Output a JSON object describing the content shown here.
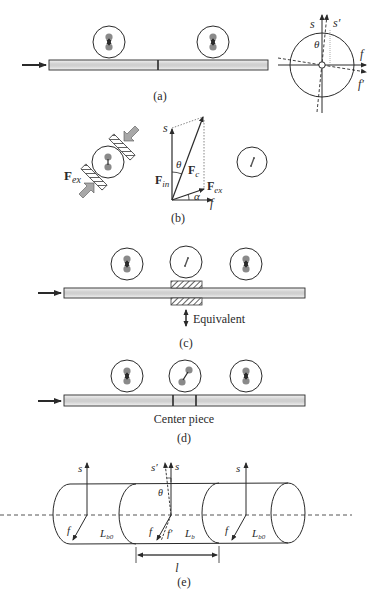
{
  "panels": {
    "a": {
      "caption": "(a)",
      "axes": {
        "s": "s",
        "s_prime": "s′",
        "f": "f",
        "f_prime": "f′",
        "theta": "θ"
      }
    },
    "b": {
      "caption": "(b)",
      "force_ex": "F",
      "force_ex_sub": "ex",
      "vector": {
        "s": "s",
        "f": "f",
        "theta": "θ",
        "alpha": "α",
        "F_in": "F",
        "F_in_sub": "in",
        "F_c": "F",
        "F_c_sub": "c",
        "F_ex": "F",
        "F_ex_sub": "ex"
      }
    },
    "c": {
      "caption": "(c)",
      "equivalent_label": "Equivalent"
    },
    "d": {
      "caption": "(d)",
      "center_label": "Center piece"
    },
    "e": {
      "caption": "(e)",
      "labels": {
        "s": "s",
        "s_prime": "s′",
        "f": "f",
        "f_prime": "f′",
        "theta": "θ",
        "L": "L",
        "L_b0_sub": "b0",
        "L_b_sub": "b",
        "l": "l"
      }
    }
  },
  "colors": {
    "line": "#2a2a2a",
    "fiber_core": "#c8c8c8",
    "dot": "#8a8a8a",
    "hatch": "#3a3a3a",
    "arrow_fill": "#a8a8a8"
  }
}
